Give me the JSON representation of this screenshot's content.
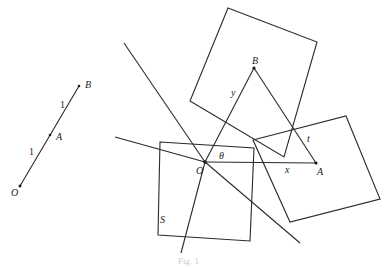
{
  "figure": {
    "left_diagram": {
      "points": {
        "O": "O",
        "A": "A",
        "B": "B"
      },
      "segment_labels": [
        "1",
        "1"
      ]
    },
    "right_diagram": {
      "points": {
        "O": "O",
        "A": "A",
        "B": "B"
      },
      "labels": {
        "theta": "θ",
        "x": "x",
        "y": "y",
        "t": "t",
        "S": "S"
      }
    },
    "caption": "Fig. 1"
  },
  "colors": {
    "stroke": "#2a2a2a",
    "background": "#ffffff"
  }
}
